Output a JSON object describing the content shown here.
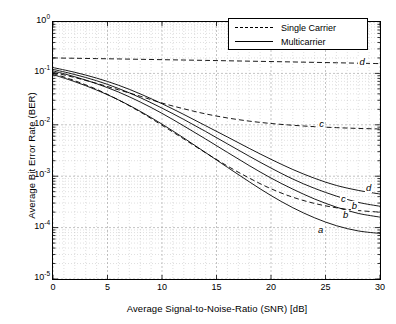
{
  "chart_data": {
    "type": "line",
    "title": "",
    "xlabel": "Average Signal-to-Noise-Ratio (SNR) [dB]",
    "ylabel": "Average Bit Error Rate (BER)",
    "xlim": [
      0,
      30
    ],
    "ylim": [
      1e-05,
      1
    ],
    "yscale": "log",
    "xticks": [
      0,
      5,
      10,
      15,
      20,
      25,
      30
    ],
    "xticklabels": [
      "0",
      "5",
      "10",
      "15",
      "20",
      "25",
      "30"
    ],
    "yticks": [
      1,
      0.1,
      0.01,
      0.001,
      0.0001,
      1e-05
    ],
    "yticklabels": [
      "10⁰",
      "10⁻¹",
      "10⁻²",
      "10⁻³",
      "10⁻⁴",
      "10⁻⁵"
    ],
    "grid": true,
    "grid_style": "dotted-minor",
    "legend_position": "top-right",
    "legend": [
      {
        "label": "Single Carrier",
        "style": "dashed"
      },
      {
        "label": "Multicarrier",
        "style": "solid"
      }
    ],
    "x": [
      0,
      2,
      4,
      6,
      8,
      10,
      12,
      14,
      16,
      18,
      20,
      22,
      24,
      26,
      28,
      30
    ],
    "series": [
      {
        "name": "d-single-carrier",
        "label": "d",
        "style": "dashed",
        "values": [
          0.2,
          0.197,
          0.194,
          0.191,
          0.188,
          0.185,
          0.182,
          0.179,
          0.176,
          0.173,
          0.17,
          0.167,
          0.164,
          0.161,
          0.158,
          0.155
        ]
      },
      {
        "name": "c-single-carrier",
        "label": "c",
        "style": "dashed",
        "values": [
          0.105,
          0.083,
          0.064,
          0.048,
          0.036,
          0.0265,
          0.0205,
          0.0163,
          0.0136,
          0.0118,
          0.0106,
          0.0098,
          0.0092,
          0.0088,
          0.0085,
          0.0083
        ]
      },
      {
        "name": "b-single-carrier",
        "label": "b",
        "style": "dashed",
        "values": [
          0.1,
          0.072,
          0.049,
          0.0305,
          0.0178,
          0.0098,
          0.0053,
          0.00285,
          0.00158,
          0.00092,
          0.00057,
          0.00039,
          0.000295,
          0.000243,
          0.000215,
          0.0002
        ]
      },
      {
        "name": "d-multicarrier",
        "label": "d",
        "style": "solid",
        "values": [
          0.13,
          0.105,
          0.081,
          0.059,
          0.04,
          0.0257,
          0.0159,
          0.0096,
          0.0058,
          0.00348,
          0.00213,
          0.00135,
          0.00091,
          0.00066,
          0.00053,
          0.00045
        ]
      },
      {
        "name": "c-multicarrier",
        "label": "c",
        "style": "solid",
        "values": [
          0.12,
          0.095,
          0.072,
          0.051,
          0.0338,
          0.0211,
          0.0127,
          0.00742,
          0.00426,
          0.00245,
          0.00144,
          0.00088,
          0.00058,
          0.00041,
          0.00031,
          0.00026
        ]
      },
      {
        "name": "b-multicarrier",
        "label": "b",
        "style": "solid",
        "values": [
          0.112,
          0.086,
          0.063,
          0.0435,
          0.0278,
          0.0167,
          0.0095,
          0.0053,
          0.00291,
          0.00161,
          0.00092,
          0.00056,
          0.00036,
          0.00025,
          0.000189,
          0.00016
        ]
      },
      {
        "name": "a-multicarrier",
        "label": "a",
        "style": "solid",
        "values": [
          0.095,
          0.069,
          0.0475,
          0.0306,
          0.0183,
          0.0103,
          0.00553,
          0.00288,
          0.00149,
          0.00078,
          0.00042,
          0.000244,
          0.000155,
          0.000109,
          8.62e-05,
          7.7e-05
        ]
      }
    ],
    "annotations": [
      {
        "text": "d",
        "x": 28.3,
        "y": 0.165,
        "style": "italic"
      },
      {
        "text": "c",
        "x": 24.6,
        "y": 0.0105,
        "style": "italic"
      },
      {
        "text": "b",
        "x": 27.6,
        "y": 0.00026,
        "style": "italic"
      },
      {
        "text": "d",
        "x": 28.9,
        "y": 0.00058,
        "style": "italic"
      },
      {
        "text": "c",
        "x": 26.6,
        "y": 0.00036,
        "style": "italic"
      },
      {
        "text": "b",
        "x": 26.8,
        "y": 0.000175,
        "style": "italic"
      },
      {
        "text": "a",
        "x": 24.5,
        "y": 8.85e-05,
        "style": "italic"
      }
    ]
  },
  "axes": {
    "xlabel": "Average Signal-to-Noise-Ratio (SNR) [dB]",
    "ylabel": "Average Bit Error Rate (BER)"
  },
  "legend": {
    "rows": [
      {
        "label": "Single Carrier"
      },
      {
        "label": "Multicarrier"
      }
    ]
  },
  "colors": {
    "line": "#000000",
    "grid": "#bfbfbf",
    "axis": "#000000",
    "background": "#ffffff"
  }
}
